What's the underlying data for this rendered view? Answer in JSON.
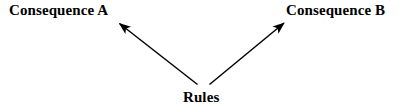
{
  "diagram": {
    "type": "flow-diagram",
    "background_color": "#ffffff",
    "stroke_color": "#000000",
    "nodes": {
      "source": {
        "id": "rules",
        "label": "Rules"
      },
      "targets": [
        {
          "id": "consequence-a",
          "label": "Consequence A"
        },
        {
          "id": "consequence-b",
          "label": "Consequence B"
        }
      ]
    },
    "edges": [
      {
        "from": "Rules",
        "to": "Consequence A",
        "direction": "up-left",
        "arrowhead": "end"
      },
      {
        "from": "Rules",
        "to": "Consequence B",
        "direction": "up-right",
        "arrowhead": "end"
      }
    ]
  }
}
